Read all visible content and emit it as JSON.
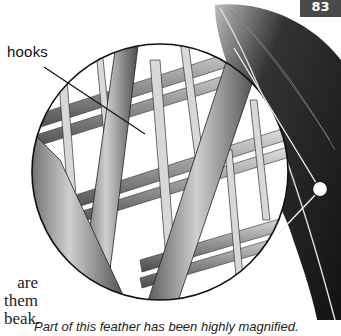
{
  "page": {
    "number": "83",
    "label_hooks": "hooks",
    "body_text_fragments": [
      "are",
      "them",
      "beak."
    ],
    "caption": "Part of this feather has been highly magnified."
  },
  "illustration": {
    "subject": "magnified feather barbules with hooks",
    "colors": {
      "ink": "#111111",
      "barb_light": "#d9d9d9",
      "barb_mid": "#8c8c8c",
      "barb_dark": "#3a3a3a",
      "feather_dark": "#1e1e1e",
      "page_tab": "#4a4a4a"
    }
  }
}
